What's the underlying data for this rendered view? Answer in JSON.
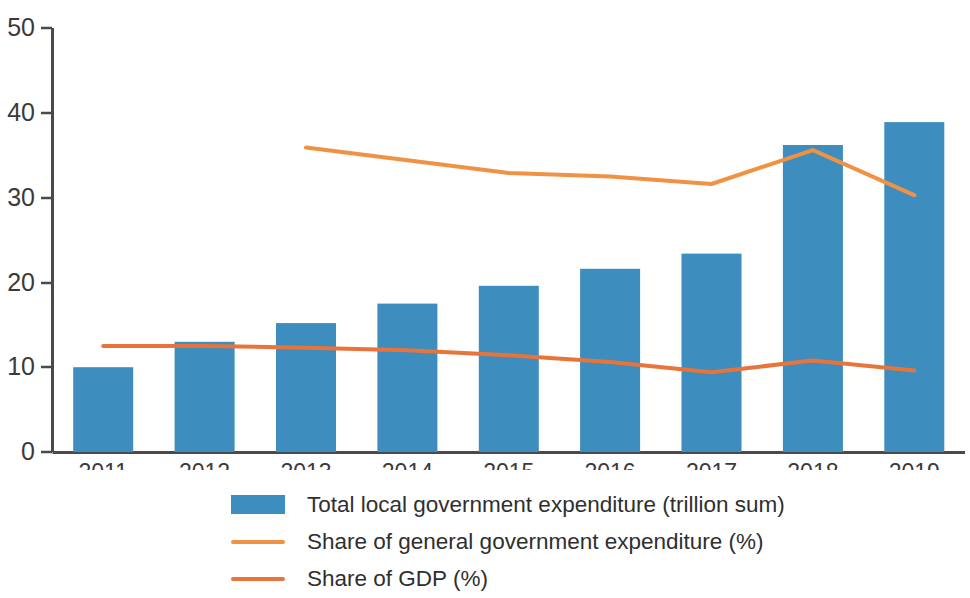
{
  "chart_data": {
    "type": "bar",
    "title": "",
    "subtitle": "",
    "xlabel": "",
    "ylabel": "",
    "categories": [
      "2011",
      "2012",
      "2013",
      "2014",
      "2015",
      "2016",
      "2017",
      "2018",
      "2019"
    ],
    "ylim": [
      0,
      50
    ],
    "yticks": [
      0,
      10,
      20,
      30,
      40,
      50
    ],
    "ytick_labels": [
      "0",
      "10",
      "20",
      "30",
      "40",
      "50"
    ],
    "grid": false,
    "legend_position": "bottom",
    "series": [
      {
        "name": "Total local government expenditure (trillion sum)",
        "type": "bar",
        "color": "#3d8dbe",
        "values": [
          10.0,
          13.0,
          15.2,
          17.5,
          19.6,
          21.6,
          23.4,
          36.2,
          38.9
        ]
      },
      {
        "name": "Share of general government expenditure (%)",
        "type": "line",
        "color": "#f09243",
        "x": [
          "2013",
          "2014",
          "2015",
          "2016",
          "2017",
          "2018",
          "2019"
        ],
        "values": [
          35.9,
          34.4,
          32.9,
          32.5,
          31.6,
          35.6,
          30.3
        ]
      },
      {
        "name": "Share of GDP (%)",
        "type": "line",
        "color": "#e8743b",
        "x": [
          "2011",
          "2012",
          "2013",
          "2014",
          "2015",
          "2016",
          "2017",
          "2018",
          "2019"
        ],
        "values": [
          12.5,
          12.5,
          12.3,
          12.0,
          11.4,
          10.6,
          9.4,
          10.8,
          9.6
        ]
      }
    ]
  },
  "axis": {
    "y_tick_labels": [
      "50",
      "40",
      "30",
      "20",
      "10",
      "0"
    ],
    "x_tick_labels": [
      "2011",
      "2012",
      "2013",
      "2014",
      "2015",
      "2016",
      "2017",
      "2018",
      "2019"
    ]
  },
  "legend": {
    "items": [
      {
        "label": "Total local government expenditure (trillion sum)",
        "marker": "bar-swatch",
        "color": "#3d8dbe"
      },
      {
        "label": "Share of general government expenditure (%)",
        "marker": "line-swatch",
        "color": "#f09243"
      },
      {
        "label": "Share of GDP (%)",
        "marker": "line-swatch",
        "color": "#e8743b"
      }
    ]
  },
  "colors": {
    "bar": "#3d8dbe",
    "line_general_expenditure": "#f09243",
    "line_gdp": "#e8743b",
    "axis": "#4a4a4a",
    "text": "#3a3a3a",
    "background": "#ffffff"
  }
}
